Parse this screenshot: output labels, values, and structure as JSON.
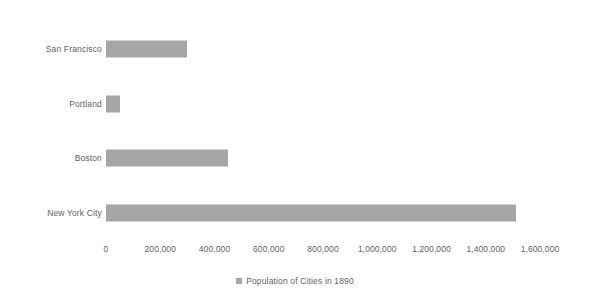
{
  "chart_data": {
    "type": "bar",
    "orientation": "horizontal",
    "title": "",
    "xlabel": "",
    "ylabel": "",
    "categories": [
      "San Francisco",
      "Portland",
      "Boston",
      "New York City"
    ],
    "values": [
      300000,
      50000,
      450000,
      1510000
    ],
    "series": [
      {
        "name": "Population of Cities in 1890",
        "values": [
          300000,
          50000,
          450000,
          1510000
        ],
        "color": "#a6a6a6"
      }
    ],
    "xlim": [
      0,
      1600000
    ],
    "x_ticks": [
      0,
      200000,
      400000,
      600000,
      800000,
      1000000,
      1200000,
      1400000,
      1600000
    ],
    "x_tick_labels": [
      "0",
      "200,000",
      "400,000",
      "600,000",
      "800,000",
      "1,000,000",
      "1,200,000",
      "1,400,000",
      "1,600,000"
    ],
    "grid": false,
    "legend": {
      "position": "bottom",
      "entries": [
        {
          "label": "Population of Cities in 1890",
          "color": "#a6a6a6",
          "marker": "square"
        }
      ]
    }
  },
  "colors": {
    "bar": "#a6a6a6",
    "text": "#5f5f5f",
    "background": "#ffffff"
  }
}
